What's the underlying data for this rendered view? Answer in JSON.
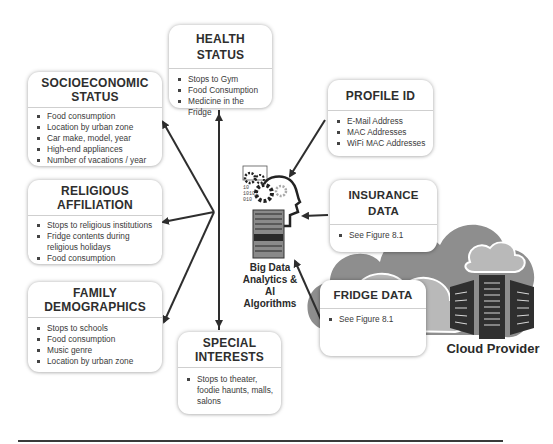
{
  "central": {
    "label_line1": "Big Data",
    "label_line2": "Analytics &",
    "label_line3": "AI Algorithms",
    "icon": "brain-gears-server-icon"
  },
  "cloud": {
    "label": "Cloud Provider",
    "icon": "cloud-servers-icon"
  },
  "boxes": {
    "health": {
      "title": "HEALTH STATUS",
      "items": [
        "Stops to Gym",
        "Food Consumption",
        "Medicine in the Fridge"
      ]
    },
    "socioeconomic": {
      "title_line1": "SOCIOECONOMIC",
      "title_line2": "STATUS",
      "items": [
        "Food consumption",
        "Location by urban zone",
        "Car make, model, year",
        "High-end appliances",
        "Number of vacations / year"
      ]
    },
    "religious": {
      "title_line1": "RELIGIOUS",
      "title_line2": "AFFILIATION",
      "items": [
        "Stops to religious institutions",
        "Fridge contents during religious holidays",
        "Food consumption"
      ]
    },
    "family": {
      "title_line1": "FAMILY",
      "title_line2": "DEMOGRAPHICS",
      "items": [
        "Stops to schools",
        "Food consumption",
        "Music genre",
        "Location by urban zone"
      ]
    },
    "special": {
      "title_line1": "SPECIAL",
      "title_line2": "INTERESTS",
      "items": [
        "Stops to theater, foodie haunts, malls, salons"
      ]
    },
    "profile": {
      "title": "PROFILE ID",
      "items": [
        "E-Mail Address",
        "MAC Addresses",
        "WiFi MAC Addresses"
      ]
    },
    "insurance": {
      "title": "INSURANCE DATA",
      "items": [
        "See Figure 8.1"
      ]
    },
    "fridge": {
      "title": "FRIDGE DATA",
      "items": [
        "See Figure 8.1"
      ]
    }
  },
  "colors": {
    "arrow": "#2e2e2e",
    "cloud_dark": "#8e8e8e",
    "cloud_light": "#b9b9b9",
    "server": "#2f2f2f"
  }
}
